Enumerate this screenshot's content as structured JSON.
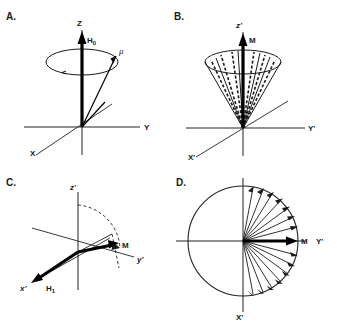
{
  "figure": {
    "background_color": "#ffffff",
    "ink_color": "#1a1a1a",
    "width": 337,
    "height": 323
  },
  "panels": [
    {
      "id": "A",
      "label": "A.",
      "description": "Single magnetic moment precessing about the static field H0 along the laboratory Z axis",
      "axes": [
        {
          "name": "z-axis",
          "label": "Z"
        },
        {
          "name": "y-axis",
          "label": "Y"
        },
        {
          "name": "x-axis",
          "label": "X"
        }
      ],
      "vectors": [
        {
          "name": "h0-vector",
          "label": "H",
          "subscript": "0",
          "style": "bold-solid",
          "direction": "+Z"
        },
        {
          "name": "mu-vector",
          "label": "μ",
          "style": "thin-solid",
          "direction": "cone-surface"
        }
      ],
      "shapes": [
        {
          "name": "precession-cone-ellipse",
          "type": "ellipse"
        }
      ]
    },
    {
      "id": "B",
      "label": "B.",
      "description": "Ensemble of moments distributed on a cone summing to net magnetization M along z-prime",
      "axes": [
        {
          "name": "z-prime-axis",
          "label": "z'"
        },
        {
          "name": "y-prime-axis",
          "label": "Y'"
        },
        {
          "name": "x-prime-axis",
          "label": "X'"
        }
      ],
      "vectors": [
        {
          "name": "m-vector",
          "label": "M",
          "style": "bold-solid",
          "direction": "+z'"
        },
        {
          "name": "moment-fan",
          "label": "",
          "style": "dashed",
          "count": 7
        }
      ],
      "shapes": [
        {
          "name": "magnetization-cone",
          "type": "cone"
        }
      ]
    },
    {
      "id": "C",
      "label": "C.",
      "description": "Rotating frame: H1 field applied along minus x-prime tips M from z-prime toward y-prime",
      "axes": [
        {
          "name": "z-prime-axis",
          "label": "z'"
        },
        {
          "name": "y-prime-axis",
          "label": "y'"
        },
        {
          "name": "x-prime-axis",
          "label": "x'"
        }
      ],
      "vectors": [
        {
          "name": "h1-vector",
          "label": "H",
          "subscript": "1",
          "style": "bold-solid",
          "direction": "-x'"
        },
        {
          "name": "m-vector",
          "label": "M",
          "style": "bold-solid",
          "direction": "tipped"
        }
      ],
      "shapes": [
        {
          "name": "rotation-arc",
          "type": "dashed-arc"
        },
        {
          "name": "projection-line",
          "type": "dashed-line"
        }
      ]
    },
    {
      "id": "D",
      "label": "D.",
      "description": "Transverse plane view: dephasing of isochromats fanning out about M along Y-prime",
      "axes": [
        {
          "name": "y-prime-axis",
          "label": "Y'"
        },
        {
          "name": "x-prime-axis",
          "label": "X'"
        }
      ],
      "vectors": [
        {
          "name": "m-vector",
          "label": "M",
          "style": "bold-solid",
          "direction": "+Y'"
        },
        {
          "name": "isochromat-fan",
          "label": "",
          "style": "thin-solid",
          "count": 16
        }
      ],
      "shapes": [
        {
          "name": "transverse-plane-circle",
          "type": "circle"
        }
      ]
    }
  ]
}
